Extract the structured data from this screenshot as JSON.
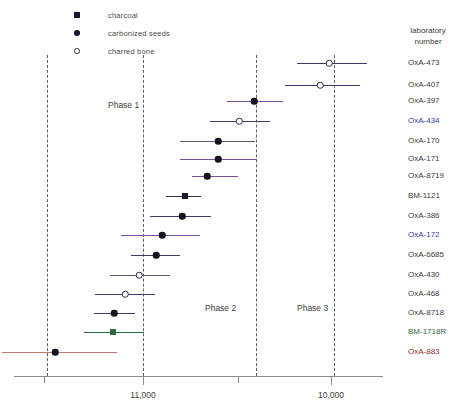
{
  "legend": {
    "items": [
      {
        "marker": "filled-square",
        "label": "charcoal",
        "icon": "filled-square-icon"
      },
      {
        "marker": "filled-circle",
        "label": "carbonized seeds",
        "icon": "filled-circle-icon"
      },
      {
        "marker": "open-circle",
        "label": "charred bone",
        "icon": "open-circle-icon"
      }
    ]
  },
  "axis": {
    "label": "",
    "ticks": [
      {
        "value": "",
        "x": 44,
        "major": false
      },
      {
        "value": "11,000",
        "x": 143,
        "major": true
      },
      {
        "value": "",
        "x": 238,
        "major": false
      },
      {
        "value": "10,000",
        "x": 331,
        "major": true
      }
    ],
    "x_start": 14,
    "x_end": 383
  },
  "phases": [
    {
      "label": "Phase 1",
      "x": 108,
      "y": 100
    },
    {
      "label": "Phase 2",
      "x": 205,
      "y": 303
    },
    {
      "label": "Phase 3",
      "x": 297,
      "y": 303
    }
  ],
  "dividers": [
    {
      "x": 47,
      "y_top": 55,
      "y_bottom": 376
    },
    {
      "x": 143,
      "y_top": 55,
      "y_bottom": 376
    },
    {
      "x": 256,
      "y_top": 55,
      "y_bottom": 376
    },
    {
      "x": 334,
      "y_top": 55,
      "y_bottom": 376
    }
  ],
  "label_column": {
    "header_line1": "laboratory",
    "header_line2": "number",
    "header_x": 430,
    "header_y": 26
  },
  "colors": {
    "navy": "#3b3b6e",
    "purple": "#7a4f9e",
    "dark": "#332f44",
    "gray_navy": "#5a5a78",
    "green": "#2f6b3a",
    "salmon": "#c07a6e",
    "axis": "#8b8b8b",
    "label_black": "#3d3d3d",
    "label_blue": "#3a3aa8",
    "label_green": "#2f6b3a",
    "label_red": "#8b2f2f"
  },
  "chart_data": {
    "type": "scatter",
    "title": "",
    "xlabel": "",
    "ylabel": "laboratory number",
    "xlim": [
      11500,
      9850
    ],
    "x_axis_direction": "decreasing",
    "grid": false,
    "legend_position": "top-left",
    "legend_entries": [
      "charcoal",
      "carbonized seeds",
      "charred bone"
    ],
    "annotations": [
      "Phase 1",
      "Phase 2",
      "Phase 3"
    ],
    "phase_boundaries_px": [
      47,
      143,
      256,
      334
    ],
    "points": [
      {
        "label": "OxA-473",
        "y": 63,
        "center_px": 329,
        "lo_px": 297,
        "hi_px": 367,
        "marker": "open-circle",
        "bar_color": "navy",
        "label_color": "label_black"
      },
      {
        "label": "OxA-407",
        "y": 85,
        "center_px": 320,
        "lo_px": 285,
        "hi_px": 360,
        "marker": "open-circle",
        "bar_color": "navy",
        "label_color": "label_black"
      },
      {
        "label": "OxA-397",
        "y": 101,
        "center_px": 254,
        "lo_px": 227,
        "hi_px": 283,
        "marker": "filled-circle",
        "bar_color": "purple",
        "label_color": "label_black"
      },
      {
        "label": "OxA-434",
        "y": 121,
        "center_px": 239,
        "lo_px": 210,
        "hi_px": 270,
        "marker": "open-circle",
        "bar_color": "navy",
        "label_color": "label_blue"
      },
      {
        "label": "OxA-170",
        "y": 141,
        "center_px": 218,
        "lo_px": 180,
        "hi_px": 255,
        "marker": "filled-circle",
        "bar_color": "gray_navy",
        "label_color": "label_black"
      },
      {
        "label": "OxA-171",
        "y": 159,
        "center_px": 218,
        "lo_px": 180,
        "hi_px": 257,
        "marker": "filled-circle",
        "bar_color": "purple",
        "label_color": "label_black"
      },
      {
        "label": "OxA-8719",
        "y": 176,
        "center_px": 207,
        "lo_px": 192,
        "hi_px": 238,
        "marker": "filled-circle",
        "bar_color": "purple",
        "label_color": "label_black"
      },
      {
        "label": "BM-1121",
        "y": 196,
        "center_px": 185,
        "lo_px": 166,
        "hi_px": 201,
        "marker": "filled-square",
        "bar_color": "dark",
        "label_color": "label_black"
      },
      {
        "label": "OxA-386",
        "y": 216,
        "center_px": 182,
        "lo_px": 150,
        "hi_px": 211,
        "marker": "filled-circle",
        "bar_color": "navy",
        "label_color": "label_black"
      },
      {
        "label": "OxA-172",
        "y": 235,
        "center_px": 162,
        "lo_px": 121,
        "hi_px": 200,
        "marker": "filled-circle",
        "bar_color": "purple",
        "label_color": "label_blue"
      },
      {
        "label": "OxA-6685",
        "y": 255,
        "center_px": 156,
        "lo_px": 131,
        "hi_px": 180,
        "marker": "filled-circle",
        "bar_color": "navy",
        "label_color": "label_black"
      },
      {
        "label": "OxA-430",
        "y": 275,
        "center_px": 139,
        "lo_px": 110,
        "hi_px": 170,
        "marker": "open-circle",
        "bar_color": "gray_navy",
        "label_color": "label_black"
      },
      {
        "label": "OxA-468",
        "y": 294,
        "center_px": 125,
        "lo_px": 95,
        "hi_px": 155,
        "marker": "open-circle",
        "bar_color": "navy",
        "label_color": "label_black"
      },
      {
        "label": "OxA-8718",
        "y": 313,
        "center_px": 114,
        "lo_px": 94,
        "hi_px": 135,
        "marker": "filled-circle",
        "bar_color": "navy",
        "label_color": "label_black"
      },
      {
        "label": "BM-1718R",
        "y": 332,
        "center_px": 113,
        "lo_px": 84,
        "hi_px": 144,
        "marker": "filled-square",
        "bar_color": "green",
        "label_color": "label_green"
      },
      {
        "label": "OxA-883",
        "y": 352,
        "center_px": 55,
        "lo_px": 2,
        "hi_px": 117,
        "marker": "filled-circle",
        "bar_color": "salmon",
        "label_color": "label_red"
      }
    ]
  }
}
